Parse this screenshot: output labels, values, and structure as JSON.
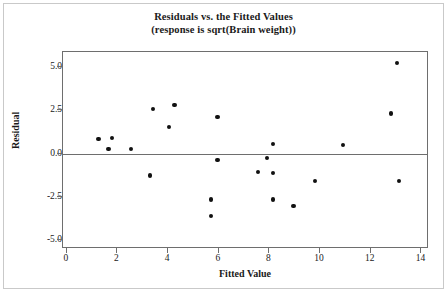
{
  "chart_data": {
    "type": "scatter",
    "title": "Residuals vs. the Fitted Values",
    "subtitle": "(response is sqrt(Brain weight))",
    "xlabel": "Fitted Value",
    "ylabel": "Residual",
    "xlim": [
      -0.15,
      14.3
    ],
    "ylim": [
      -5.55,
      5.9
    ],
    "grid": false,
    "legend": null,
    "reference_line": {
      "orientation": "horizontal",
      "y": 0.0
    },
    "xticks": [
      "0",
      "2",
      "4",
      "6",
      "8",
      "10",
      "12",
      "14"
    ],
    "xtick_values": [
      0,
      2,
      4,
      6,
      8,
      10,
      12,
      14
    ],
    "yticks": [
      "5.0",
      "2.5",
      "0.0",
      "-2.5",
      "-5.0"
    ],
    "ytick_values": [
      5.0,
      2.5,
      0.0,
      -2.5,
      -5.0
    ],
    "points": [
      {
        "x": 1.25,
        "y": 0.83
      },
      {
        "x": 1.65,
        "y": 0.28
      },
      {
        "x": 1.8,
        "y": 0.89
      },
      {
        "x": 2.55,
        "y": 0.28
      },
      {
        "x": 3.3,
        "y": -1.28
      },
      {
        "x": 3.4,
        "y": 2.61
      },
      {
        "x": 4.05,
        "y": 1.56
      },
      {
        "x": 4.25,
        "y": 2.83
      },
      {
        "x": 5.7,
        "y": -2.67
      },
      {
        "x": 5.7,
        "y": -3.61
      },
      {
        "x": 5.95,
        "y": 2.11
      },
      {
        "x": 5.95,
        "y": -0.39
      },
      {
        "x": 7.55,
        "y": -1.06
      },
      {
        "x": 7.9,
        "y": -0.28
      },
      {
        "x": 8.15,
        "y": 0.55
      },
      {
        "x": 8.15,
        "y": -1.11
      },
      {
        "x": 8.15,
        "y": -2.67
      },
      {
        "x": 8.95,
        "y": -3.06
      },
      {
        "x": 9.8,
        "y": -1.61
      },
      {
        "x": 10.9,
        "y": 0.5
      },
      {
        "x": 12.8,
        "y": 2.33
      },
      {
        "x": 13.05,
        "y": 5.28
      },
      {
        "x": 13.1,
        "y": -1.61
      }
    ],
    "colors": {
      "marker": "#111111",
      "axis": "#6e6e6e",
      "text": "#1a1a1a",
      "background": "#ffffff",
      "border": "#c9c9c9"
    }
  }
}
